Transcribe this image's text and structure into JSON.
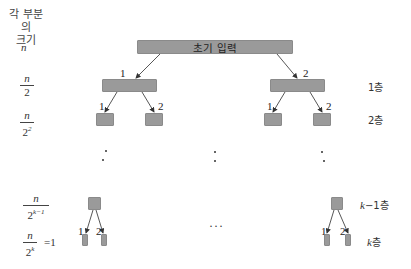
{
  "header": {
    "line1": "각 부분의",
    "line2": "크기"
  },
  "root": {
    "label": "초기 입력"
  },
  "size_labels": {
    "n": "n",
    "level1": {
      "num": "n",
      "den": "2"
    },
    "level2": {
      "num": "n",
      "den": "2",
      "exp": "2"
    },
    "levelk1": {
      "num": "n",
      "den": "2",
      "exp": "k−1"
    },
    "levelk": {
      "num": "n",
      "den": "2",
      "exp": "k",
      "eq": "=1"
    }
  },
  "level_labels": {
    "l1": "1층",
    "l2": "2층",
    "lk1_var": "k",
    "lk1_rest": "−1층",
    "lk_var": "k",
    "lk_rest": "층"
  },
  "branch_numbers": {
    "one": "1",
    "two": "2"
  },
  "ellipsis": "···",
  "colors": {
    "box_fill": "#9a9a9a",
    "arrow": "#333333",
    "text": "#333333"
  }
}
